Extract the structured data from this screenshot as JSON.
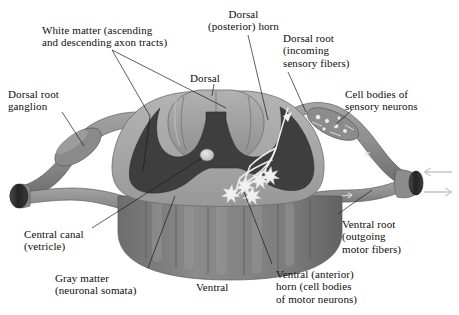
{
  "figure": {
    "background_color": "#ffffff",
    "text_color": "#0d0d0d"
  },
  "palette": {
    "white_matter": "#a8a8a8",
    "white_matter_light": "#b9b9b9",
    "gray_matter": "#3e3e3e",
    "dorsal_cap": "#999999",
    "dorsal_cap_light": "#b0b0b0",
    "nerve_root": "#8f8f8f",
    "nerve_root_shadow": "#6f6f6f",
    "ventral_lobe": "#828282",
    "ventral_lobe_dark": "#6a6a6a",
    "cut_end": "#2a2a2a",
    "neuron_white": "#f2f2f2",
    "arrow_gray": "#c9c9c9",
    "leader_line": "#1a1a1a"
  },
  "labels": [
    {
      "id": "white-matter",
      "name": "label-white-matter",
      "text": "White matter (ascending\nand descending axon tracts)",
      "x": 42,
      "y": 24,
      "align": "left"
    },
    {
      "id": "dorsal-posterior-horn",
      "name": "label-dorsal-posterior-horn",
      "text": "Dorsal\n(posterior) horn",
      "x": 208,
      "y": 8,
      "align": "center"
    },
    {
      "id": "dorsal-root",
      "name": "label-dorsal-root",
      "text": "Dorsal root\n(incoming\nsensory fibers)",
      "x": 283,
      "y": 32,
      "align": "left"
    },
    {
      "id": "dorsal-root-ganglion",
      "name": "label-dorsal-root-ganglion",
      "text": "Dorsal root\nganglion",
      "x": 8,
      "y": 88,
      "align": "left"
    },
    {
      "id": "dorsal",
      "name": "label-dorsal",
      "text": "Dorsal",
      "x": 190,
      "y": 72,
      "align": "left"
    },
    {
      "id": "cell-bodies-sensory",
      "name": "label-cell-bodies-of-sensory-neurons",
      "text": "Cell bodies of\nsensory neurons",
      "x": 345,
      "y": 88,
      "align": "left"
    },
    {
      "id": "central-canal",
      "name": "label-central-canal",
      "text": "Central canal\n(vetricle)",
      "x": 24,
      "y": 228,
      "align": "left"
    },
    {
      "id": "gray-matter",
      "name": "label-gray-matter",
      "text": "Gray matter\n(neuronal somata)",
      "x": 55,
      "y": 272,
      "align": "left"
    },
    {
      "id": "ventral",
      "name": "label-ventral",
      "text": "Ventral",
      "x": 196,
      "y": 281,
      "align": "left"
    },
    {
      "id": "ventral-root",
      "name": "label-ventral-root",
      "text": "Ventral root\n(outgoing\nmotor fibers)",
      "x": 342,
      "y": 218,
      "align": "left"
    },
    {
      "id": "ventral-anterior-horn",
      "name": "label-ventral-anterior-horn",
      "text": "Ventral (anterior)\nhorn (cell bodies\nof motor neurons)",
      "x": 276,
      "y": 268,
      "align": "left"
    }
  ],
  "structures": [
    {
      "id": "white-matter-region",
      "name": "white-matter-region",
      "description": "Outer light gray region of ascending and descending axon tracts"
    },
    {
      "id": "gray-matter-region",
      "name": "gray-matter-region",
      "description": "Central dark butterfly-shaped region of neuronal somata"
    },
    {
      "id": "dorsal-horn-left",
      "name": "dorsal-horn-left",
      "description": "Left dorsal (posterior) horn of gray matter"
    },
    {
      "id": "dorsal-horn-right",
      "name": "dorsal-horn-right",
      "description": "Right dorsal (posterior) horn of gray matter"
    },
    {
      "id": "ventral-horn-left",
      "name": "ventral-horn-left",
      "description": "Left ventral (anterior) horn of gray matter"
    },
    {
      "id": "ventral-horn-right",
      "name": "ventral-horn-right",
      "description": "Right ventral (anterior) horn of gray matter"
    },
    {
      "id": "central-canal-structure",
      "name": "central-canal-structure",
      "description": "Small light oval at the center of the gray matter"
    },
    {
      "id": "dorsal-cap",
      "name": "dorsal-cap-structure",
      "description": "Lobed dorsal surface cap with median sulcus"
    },
    {
      "id": "ventral-lobes",
      "name": "ventral-lobes-structure",
      "description": "Scalloped ventral surface columns shown in three dimensions"
    },
    {
      "id": "dorsal-root-left",
      "name": "dorsal-root-left",
      "description": "Left dorsal root with ganglion bulge"
    },
    {
      "id": "dorsal-root-right",
      "name": "dorsal-root-right",
      "description": "Right dorsal root with ganglion containing sensory cell bodies"
    },
    {
      "id": "ventral-root-left",
      "name": "ventral-root-left",
      "description": "Left ventral root carrying outgoing motor fibers"
    },
    {
      "id": "ventral-root-right",
      "name": "ventral-root-right",
      "description": "Right ventral root carrying outgoing motor fibers"
    },
    {
      "id": "spinal-nerve-left",
      "name": "spinal-nerve-left",
      "description": "Left merged spinal nerve with dark cut end"
    },
    {
      "id": "spinal-nerve-right",
      "name": "spinal-nerve-right",
      "description": "Right merged spinal nerve with dark cut end"
    },
    {
      "id": "motor-neurons",
      "name": "motor-neuron-cluster",
      "description": "Five white star-shaped multipolar motor neurons in the right ventral horn"
    },
    {
      "id": "sensory-afferent",
      "name": "sensory-afferent-fiber",
      "description": "White afferent fiber entering the right dorsal horn and branching to motor neurons"
    },
    {
      "id": "arrow-incoming",
      "name": "arrow-incoming-sensory",
      "description": "Light gray arrow pointing left into the spinal nerve"
    },
    {
      "id": "arrow-outgoing",
      "name": "arrow-outgoing-motor",
      "description": "Light gray arrow pointing right out of the spinal nerve"
    }
  ]
}
